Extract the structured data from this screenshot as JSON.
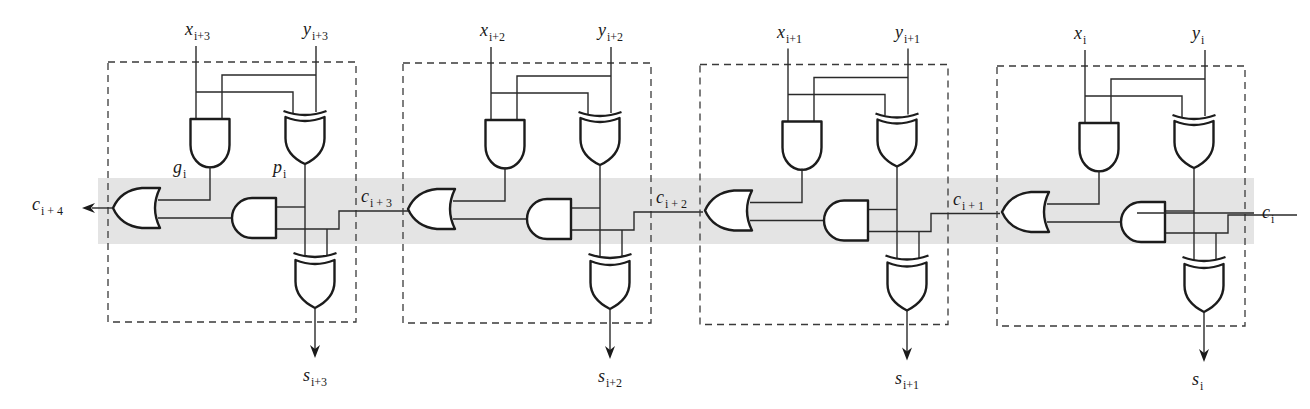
{
  "diagram": {
    "colors": {
      "carry_band": "#e4e4e4",
      "line": "#1c1c1c",
      "background": "#ffffff"
    },
    "carry_band": {
      "x": 98,
      "y": 178,
      "width": 1156,
      "height": 66
    },
    "block_label": "FA",
    "and_gate_delay": "2.4",
    "or_gate_delay": "2.4",
    "xor_gate_delay": "4.2",
    "generate_label": {
      "base": "g",
      "sub": "i"
    },
    "propagate_label": {
      "base": "p",
      "sub": "i"
    },
    "carry_out_label": {
      "base": "c",
      "sub": "i + 4"
    },
    "carry_in_label": {
      "base": "c",
      "sub": "i"
    },
    "blocks": [
      {
        "id": "bit3",
        "dx": 0,
        "dy": 0,
        "x_input": {
          "base": "x",
          "sub": "i+3"
        },
        "y_input": {
          "base": "y",
          "sub": "i+3"
        },
        "sum_output": {
          "base": "s",
          "sub": "i+3"
        },
        "carry_in": {
          "base": "c",
          "sub": "i + 3"
        },
        "show_gp_labels": true
      },
      {
        "id": "bit2",
        "dx": 295,
        "dy": 1,
        "x_input": {
          "base": "x",
          "sub": "i+2"
        },
        "y_input": {
          "base": "y",
          "sub": "i+2"
        },
        "sum_output": {
          "base": "s",
          "sub": "i+2"
        },
        "carry_in": {
          "base": "c",
          "sub": "i + 2"
        },
        "show_gp_labels": false
      },
      {
        "id": "bit1",
        "dx": 592,
        "dy": 2.5,
        "x_input": {
          "base": "x",
          "sub": "i+1"
        },
        "y_input": {
          "base": "y",
          "sub": "i+1"
        },
        "sum_output": {
          "base": "s",
          "sub": "i+1"
        },
        "carry_in": {
          "base": "c",
          "sub": "i + 1"
        },
        "show_gp_labels": false
      },
      {
        "id": "bit0",
        "dx": 889,
        "dy": 4,
        "x_input": {
          "base": "x",
          "sub": "i"
        },
        "y_input": {
          "base": "y",
          "sub": "i"
        },
        "sum_output": {
          "base": "s",
          "sub": "i"
        },
        "carry_in": {
          "base": "c",
          "sub": "i"
        },
        "show_gp_labels": false
      }
    ]
  }
}
